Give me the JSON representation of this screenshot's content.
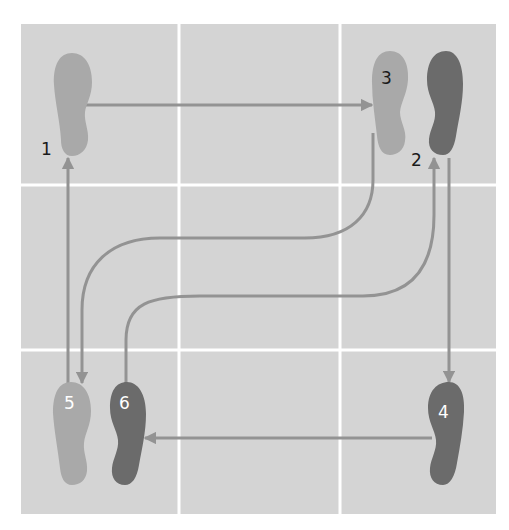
{
  "diagram": {
    "grid": {
      "rows": 3,
      "cols": 3,
      "left": 21,
      "top": 24,
      "right": 496,
      "bottom": 514,
      "col_lines": [
        179,
        340
      ],
      "row_lines": [
        185,
        350
      ],
      "cell_color": "#d4d4d4",
      "line_color": "#ffffff"
    },
    "colors": {
      "left_foot": "#a9a9a9",
      "right_foot": "#6b6b6b",
      "arrow": "#939393",
      "label_dark": "#1a1a1a",
      "label_light": "#ffffff"
    },
    "steps": [
      {
        "number": "1",
        "foot": "left",
        "label": "1",
        "label_x": 41,
        "label_y": 155
      },
      {
        "number": "2",
        "foot": "right",
        "label": "2",
        "label_x": 411,
        "label_y": 166
      },
      {
        "number": "3",
        "foot": "left",
        "label": "3",
        "label_x": 381,
        "label_y": 83
      },
      {
        "number": "4",
        "foot": "right",
        "label": "4",
        "label_x": 438,
        "label_y": 418
      },
      {
        "number": "5",
        "foot": "left",
        "label": "5",
        "label_x": 64,
        "label_y": 409
      },
      {
        "number": "6",
        "foot": "right",
        "label": "6",
        "label_x": 119,
        "label_y": 409
      }
    ]
  }
}
